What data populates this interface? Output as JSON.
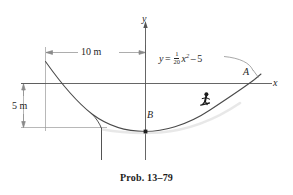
{
  "figure": {
    "caption": "Prob. 13–79",
    "axes": {
      "y_label": "y",
      "x_label": "x"
    },
    "points": [
      {
        "id": "A",
        "label": "A"
      },
      {
        "id": "B",
        "label": "B"
      }
    ],
    "equation": {
      "lhs": "y",
      "equals": "=",
      "fraction_numerator": "1",
      "fraction_denominator": "20",
      "variable": "x",
      "exponent": "2",
      "minus": "–",
      "constant": "5",
      "plain": "y = (1/20)x² – 5"
    },
    "dimensions": [
      {
        "id": "horizontal",
        "label": "10 m",
        "value": 10,
        "unit": "m"
      },
      {
        "id": "vertical",
        "label": "5 m",
        "value": 5,
        "unit": "m"
      }
    ],
    "colors": {
      "curve": "#4a4a4a",
      "axis": "#5a5a5a",
      "dimension": "#8a8a8a",
      "text": "#262626",
      "background": "#ffffff",
      "skier": "#1a1a1a"
    }
  }
}
